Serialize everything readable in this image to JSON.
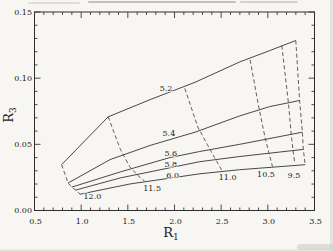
{
  "figure": {
    "background": "#f7f6f2",
    "frame_color": "#2e2e2e",
    "solid_line_color": "#333333",
    "dashed_line_color": "#4d4d4d",
    "text_color": "#1b1b1b"
  },
  "chart_data": {
    "type": "line",
    "title": "",
    "xlabel": "R",
    "xlabel_sub": "1",
    "ylabel": "R",
    "ylabel_sub": "3",
    "xlim": [
      0.5,
      3.5
    ],
    "ylim": [
      0.0,
      0.15
    ],
    "grid": false,
    "legend": "none",
    "x_major_ticks": [
      0.5,
      1.0,
      1.5,
      2.0,
      2.5,
      3.0,
      3.5
    ],
    "x_tick_labels": [
      "0.5",
      "1.0",
      "1.5",
      "2.0",
      "2.5",
      "3.0",
      "3.5"
    ],
    "x_minor_step": 0.1,
    "y_major_ticks": [
      0.0,
      0.05,
      0.1,
      0.15
    ],
    "y_tick_labels": [
      "0.00",
      "0.05",
      "0.10",
      "0.15"
    ],
    "y_minor_step": 0.01,
    "series": [
      {
        "name": "5.2",
        "style": "solid",
        "points": [
          [
            0.79,
            0.0346
          ],
          [
            1.29,
            0.0708
          ],
          [
            1.74,
            0.0838
          ],
          [
            2.22,
            0.0969
          ],
          [
            2.7,
            0.1123
          ],
          [
            3.02,
            0.1208
          ],
          [
            3.3,
            0.1285
          ]
        ]
      },
      {
        "name": "5.4",
        "style": "solid",
        "points": [
          [
            0.86,
            0.0208
          ],
          [
            1.31,
            0.0385
          ],
          [
            1.74,
            0.0492
          ],
          [
            2.22,
            0.0592
          ],
          [
            2.7,
            0.0715
          ],
          [
            3.02,
            0.0785
          ],
          [
            3.34,
            0.0831
          ]
        ]
      },
      {
        "name": "5.6",
        "style": "solid",
        "points": [
          [
            0.9,
            0.0177
          ],
          [
            1.42,
            0.0292
          ],
          [
            1.95,
            0.04
          ],
          [
            2.27,
            0.0446
          ],
          [
            2.7,
            0.05
          ],
          [
            3.37,
            0.0592
          ]
        ]
      },
      {
        "name": "5.8",
        "style": "solid",
        "points": [
          [
            0.94,
            0.0154
          ],
          [
            1.42,
            0.0246
          ],
          [
            1.95,
            0.0323
          ],
          [
            2.27,
            0.0369
          ],
          [
            2.7,
            0.0408
          ],
          [
            3.38,
            0.0462
          ]
        ]
      },
      {
        "name": "6.0",
        "style": "solid",
        "points": [
          [
            0.99,
            0.0123
          ],
          [
            1.52,
            0.02
          ],
          [
            1.97,
            0.0246
          ],
          [
            2.27,
            0.0277
          ],
          [
            2.7,
            0.0308
          ],
          [
            3.4,
            0.0346
          ]
        ]
      },
      {
        "name": "12.0",
        "style": "dashed",
        "points": [
          [
            0.79,
            0.0346
          ],
          [
            0.86,
            0.0208
          ],
          [
            0.9,
            0.0177
          ],
          [
            0.94,
            0.0154
          ],
          [
            0.99,
            0.0123
          ]
        ]
      },
      {
        "name": "11.5",
        "style": "dashed",
        "points": [
          [
            1.29,
            0.0708
          ],
          [
            1.42,
            0.0462
          ],
          [
            1.52,
            0.0331
          ],
          [
            1.61,
            0.0262
          ],
          [
            1.68,
            0.0223
          ]
        ]
      },
      {
        "name": "11.0",
        "style": "dashed",
        "points": [
          [
            2.11,
            0.0923
          ],
          [
            2.25,
            0.0631
          ],
          [
            2.35,
            0.05
          ],
          [
            2.43,
            0.04
          ],
          [
            2.51,
            0.03
          ]
        ]
      },
      {
        "name": "10.5",
        "style": "dashed",
        "points": [
          [
            2.81,
            0.1138
          ],
          [
            2.9,
            0.0792
          ],
          [
            2.97,
            0.0554
          ],
          [
            3.01,
            0.0438
          ],
          [
            3.05,
            0.0331
          ]
        ]
      },
      {
        "name": "9.5",
        "style": "dashed",
        "points": [
          [
            3.15,
            0.1246
          ],
          [
            3.22,
            0.0815
          ],
          [
            3.25,
            0.0577
          ],
          [
            3.27,
            0.0454
          ],
          [
            3.29,
            0.0354
          ]
        ]
      },
      {
        "name": "right-boundary",
        "style": "dashed",
        "points": [
          [
            3.3,
            0.1285
          ],
          [
            3.34,
            0.0831
          ],
          [
            3.37,
            0.0592
          ],
          [
            3.38,
            0.0462
          ],
          [
            3.4,
            0.0346
          ]
        ]
      }
    ],
    "curve_labels": [
      {
        "text": "5.2",
        "r1": 1.91,
        "r3": 0.0927
      },
      {
        "text": "5.4",
        "r1": 1.94,
        "r3": 0.0585
      },
      {
        "text": "5.6",
        "r1": 1.96,
        "r3": 0.0435
      },
      {
        "text": "5.8",
        "r1": 1.96,
        "r3": 0.0348
      },
      {
        "text": "6.0",
        "r1": 1.98,
        "r3": 0.0265
      },
      {
        "text": "12.0",
        "r1": 1.12,
        "r3": 0.0106
      },
      {
        "text": "11.5",
        "r1": 1.76,
        "r3": 0.0169
      },
      {
        "text": "11.0",
        "r1": 2.57,
        "r3": 0.0254
      },
      {
        "text": "10.5",
        "r1": 2.98,
        "r3": 0.0273
      },
      {
        "text": "9.5",
        "r1": 3.28,
        "r3": 0.0269
      }
    ]
  }
}
